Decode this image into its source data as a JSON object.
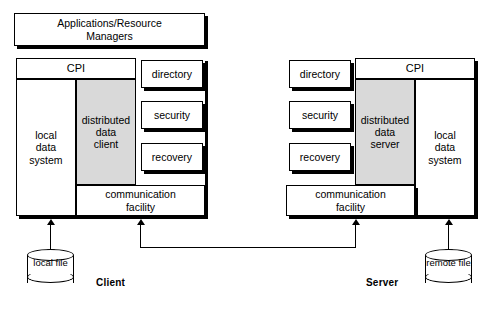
{
  "diagram": {
    "colors": {
      "shaded_fill": "#d9d9d9",
      "box_fill": "#ffffff",
      "line": "#000000"
    }
  },
  "top": {
    "applications_label": "Applications/Resource\nManagers",
    "applications_line1": "Applications/Resource",
    "applications_line2": "Managers"
  },
  "client": {
    "section_label": "Client",
    "cpi_label": "CPI",
    "local_data_system": "local\ndata\nsystem",
    "local_data_system_lines": [
      "local",
      "data",
      "system"
    ],
    "distributed_data": "distributed\ndata\nclient",
    "distributed_data_lines": [
      "distributed",
      "data",
      "client"
    ],
    "services": [
      {
        "label": "directory"
      },
      {
        "label": "security"
      },
      {
        "label": "recovery"
      }
    ],
    "communication_facility_lines": [
      "communication",
      "facility"
    ],
    "store": {
      "label_lines": [
        "local",
        "file"
      ],
      "name": "local file"
    }
  },
  "server": {
    "section_label": "Server",
    "cpi_label": "CPI",
    "local_data_system_lines": [
      "local",
      "data",
      "system"
    ],
    "distributed_data_lines": [
      "distributed",
      "data",
      "server"
    ],
    "services": [
      {
        "label": "directory"
      },
      {
        "label": "security"
      },
      {
        "label": "recovery"
      }
    ],
    "communication_facility_lines": [
      "communication",
      "facility"
    ],
    "store": {
      "label_lines": [
        "remote",
        "file"
      ],
      "name": "remote file"
    }
  }
}
